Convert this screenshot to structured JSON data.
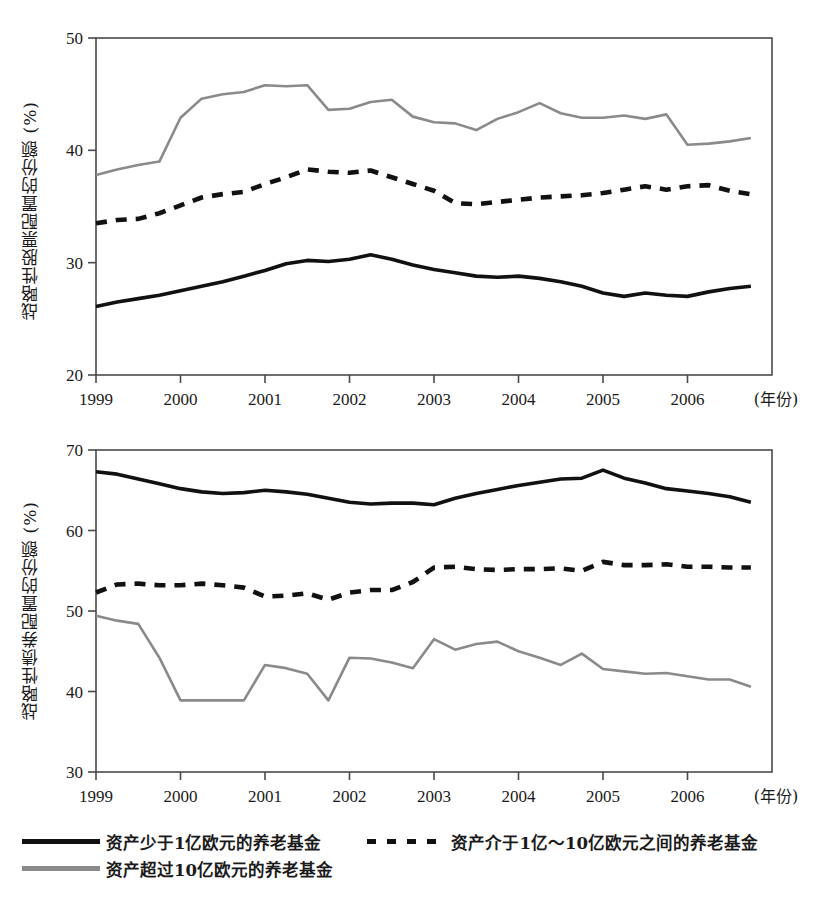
{
  "legend": {
    "entries": [
      {
        "label": "资产少于1亿欧元的养老基金",
        "style": "solid",
        "color": "#111111"
      },
      {
        "label": "资产介于1亿～10亿欧元之间的养老基金",
        "style": "dashed",
        "color": "#111111"
      },
      {
        "label": "资产超过10亿欧元的养老基金",
        "style": "solid",
        "color": "#8a8a8a"
      }
    ]
  },
  "chart_data": [
    {
      "type": "line",
      "id": "equity-allocation",
      "title": "",
      "xlabel": "(年份)",
      "ylabel": "战略性股票配置的份额 (%)",
      "xlim": [
        1999,
        2007
      ],
      "ylim": [
        20,
        50
      ],
      "yticks": [
        20,
        30,
        40,
        50
      ],
      "xticks": [
        1999,
        2000,
        2001,
        2002,
        2003,
        2004,
        2005,
        2006
      ],
      "xticklabels": [
        "1999",
        "2000",
        "2001",
        "2002",
        "2003",
        "2004",
        "2005",
        "2006"
      ],
      "grid": false,
      "legend_position": "below-figure",
      "x": [
        1999.0,
        1999.25,
        1999.5,
        1999.75,
        2000.0,
        2000.25,
        2000.5,
        2000.75,
        2001.0,
        2001.25,
        2001.5,
        2001.75,
        2002.0,
        2002.25,
        2002.5,
        2002.75,
        2003.0,
        2003.25,
        2003.5,
        2003.75,
        2004.0,
        2004.25,
        2004.5,
        2004.75,
        2005.0,
        2005.25,
        2005.5,
        2005.75,
        2006.0,
        2006.25,
        2006.5,
        2006.75
      ],
      "series": [
        {
          "name": "资产少于1亿欧元的养老基金",
          "style": "solid",
          "color": "#111111",
          "values": [
            26.1,
            26.5,
            26.8,
            27.1,
            27.5,
            27.9,
            28.3,
            28.8,
            29.3,
            29.9,
            30.2,
            30.1,
            30.3,
            30.7,
            30.3,
            29.8,
            29.4,
            29.1,
            28.8,
            28.7,
            28.8,
            28.6,
            28.3,
            27.9,
            27.3,
            27.0,
            27.3,
            27.1,
            27.0,
            27.4,
            27.7,
            27.9
          ]
        },
        {
          "name": "资产介于1亿～10亿欧元之间的养老基金",
          "style": "dashed",
          "color": "#111111",
          "values": [
            33.5,
            33.8,
            33.9,
            34.4,
            35.1,
            35.8,
            36.1,
            36.3,
            37.0,
            37.6,
            38.3,
            38.1,
            38.0,
            38.2,
            37.6,
            37.0,
            36.4,
            35.3,
            35.2,
            35.4,
            35.6,
            35.8,
            35.9,
            36.0,
            36.2,
            36.5,
            36.8,
            36.5,
            36.8,
            36.9,
            36.4,
            36.1
          ]
        },
        {
          "name": "资产超过10亿欧元的养老基金",
          "style": "solid",
          "color": "#8a8a8a",
          "values": [
            37.8,
            38.3,
            38.7,
            39.0,
            42.9,
            44.6,
            45.0,
            45.2,
            45.8,
            45.7,
            45.8,
            43.6,
            43.7,
            44.3,
            44.5,
            43.0,
            42.5,
            42.4,
            41.8,
            42.8,
            43.4,
            44.2,
            43.3,
            42.9,
            42.9,
            43.1,
            42.8,
            43.2,
            40.5,
            40.6,
            40.8,
            41.1
          ]
        }
      ]
    },
    {
      "type": "line",
      "id": "bond-allocation",
      "title": "",
      "xlabel": "(年份)",
      "ylabel": "战略性债券配置的份额 (%)",
      "xlim": [
        1999,
        2007
      ],
      "ylim": [
        30,
        70
      ],
      "yticks": [
        30,
        40,
        50,
        60,
        70
      ],
      "xticks": [
        1999,
        2000,
        2001,
        2002,
        2003,
        2004,
        2005,
        2006
      ],
      "xticklabels": [
        "1999",
        "2000",
        "2001",
        "2002",
        "2003",
        "2004",
        "2005",
        "2006"
      ],
      "grid": false,
      "legend_position": "below-figure",
      "x": [
        1999.0,
        1999.25,
        1999.5,
        1999.75,
        2000.0,
        2000.25,
        2000.5,
        2000.75,
        2001.0,
        2001.25,
        2001.5,
        2001.75,
        2002.0,
        2002.25,
        2002.5,
        2002.75,
        2003.0,
        2003.25,
        2003.5,
        2003.75,
        2004.0,
        2004.25,
        2004.5,
        2004.75,
        2005.0,
        2005.25,
        2005.5,
        2005.75,
        2006.0,
        2006.25,
        2006.5,
        2006.75
      ],
      "series": [
        {
          "name": "资产少于1亿欧元的养老基金",
          "style": "solid",
          "color": "#111111",
          "values": [
            67.3,
            67.0,
            66.4,
            65.8,
            65.2,
            64.8,
            64.6,
            64.7,
            65.0,
            64.8,
            64.5,
            64.0,
            63.5,
            63.3,
            63.4,
            63.4,
            63.2,
            64.0,
            64.6,
            65.1,
            65.6,
            66.0,
            66.4,
            66.5,
            67.5,
            66.5,
            65.9,
            65.2,
            64.9,
            64.6,
            64.2,
            63.5
          ]
        },
        {
          "name": "资产介于1亿～10亿欧元之间的养老基金",
          "style": "dashed",
          "color": "#111111",
          "values": [
            52.3,
            53.3,
            53.4,
            53.2,
            53.2,
            53.4,
            53.2,
            52.9,
            51.8,
            51.9,
            52.2,
            51.4,
            52.3,
            52.6,
            52.6,
            53.6,
            55.4,
            55.5,
            55.2,
            55.1,
            55.2,
            55.2,
            55.3,
            55.0,
            56.1,
            55.7,
            55.7,
            55.8,
            55.5,
            55.5,
            55.4,
            55.4
          ]
        },
        {
          "name": "资产超过10亿欧元的养老基金",
          "style": "solid",
          "color": "#8a8a8a",
          "values": [
            49.4,
            48.8,
            48.4,
            44.2,
            38.9,
            38.9,
            38.9,
            38.9,
            43.3,
            42.9,
            42.2,
            38.9,
            44.2,
            44.1,
            43.6,
            42.9,
            46.5,
            45.2,
            45.9,
            46.2,
            45.0,
            44.2,
            43.3,
            44.7,
            42.8,
            42.5,
            42.2,
            42.3,
            41.9,
            41.5,
            41.5,
            40.6
          ]
        }
      ]
    }
  ]
}
